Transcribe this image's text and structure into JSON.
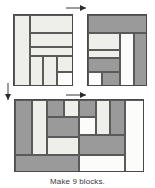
{
  "caption": "Make 9 blocks.",
  "colors": {
    "light": "#eeeeea",
    "medium": "#9a9a9a",
    "white": "#fcfcfa",
    "outline": "#4a4a4a",
    "seam": "#5a5a5a",
    "arrow": "#2a2a2a",
    "background": "#ffffff"
  },
  "arrows": [
    {
      "name": "join-top-units-arrow",
      "direction": "right"
    },
    {
      "name": "join-rows-arrow",
      "direction": "down"
    },
    {
      "name": "assemble-block-arrow",
      "direction": "right"
    }
  ],
  "units": [
    {
      "name": "top-left-unit",
      "label": "Top left unit",
      "x": 13,
      "y": 14,
      "w": 60,
      "h": 72,
      "patches": [
        {
          "name": "patch-left-tall-light",
          "fabric": "light",
          "x": 0,
          "y": 0,
          "w": 16,
          "h": 72
        },
        {
          "name": "patch-top-right-light",
          "fabric": "light",
          "x": 16,
          "y": 0,
          "w": 44,
          "h": 18
        },
        {
          "name": "patch-band-light",
          "fabric": "light",
          "x": 16,
          "y": 18,
          "w": 44,
          "h": 14
        },
        {
          "name": "patch-mid-strip-light",
          "fabric": "light",
          "x": 16,
          "y": 32,
          "w": 44,
          "h": 9
        },
        {
          "name": "patch-lower-left-light",
          "fabric": "light",
          "x": 16,
          "y": 41,
          "w": 13,
          "h": 31
        },
        {
          "name": "patch-lower-center-light",
          "fabric": "light",
          "x": 29,
          "y": 41,
          "w": 14,
          "h": 31
        },
        {
          "name": "patch-lower-right-top-light",
          "fabric": "light",
          "x": 43,
          "y": 41,
          "w": 17,
          "h": 16
        },
        {
          "name": "patch-lower-right-bot-white",
          "fabric": "white",
          "x": 43,
          "y": 57,
          "w": 17,
          "h": 15
        }
      ]
    },
    {
      "name": "top-right-unit",
      "label": "Top right unit",
      "x": 87,
      "y": 14,
      "w": 60,
      "h": 72,
      "patches": [
        {
          "name": "patch-top-band-medium",
          "fabric": "medium",
          "x": 0,
          "y": 0,
          "w": 60,
          "h": 18
        },
        {
          "name": "patch-upper-left-light",
          "fabric": "light",
          "x": 0,
          "y": 18,
          "w": 32,
          "h": 17
        },
        {
          "name": "patch-mid-left-light",
          "fabric": "light",
          "x": 0,
          "y": 35,
          "w": 32,
          "h": 8
        },
        {
          "name": "patch-mid-left-medium",
          "fabric": "medium",
          "x": 0,
          "y": 43,
          "w": 32,
          "h": 14
        },
        {
          "name": "patch-bottom-left-white",
          "fabric": "white",
          "x": 0,
          "y": 57,
          "w": 14,
          "h": 15
        },
        {
          "name": "patch-bottom-mid-medium",
          "fabric": "medium",
          "x": 14,
          "y": 57,
          "w": 18,
          "h": 15
        },
        {
          "name": "patch-tall-white",
          "fabric": "white",
          "x": 32,
          "y": 18,
          "w": 14,
          "h": 54
        },
        {
          "name": "patch-right-tall-medium",
          "fabric": "medium",
          "x": 46,
          "y": 18,
          "w": 14,
          "h": 54
        }
      ]
    },
    {
      "name": "assembled-block-unit",
      "label": "Assembled block",
      "x": 14,
      "y": 99,
      "w": 130,
      "h": 73,
      "patches": [
        {
          "name": "patch-left-tall-medium",
          "fabric": "medium",
          "x": 0,
          "y": 0,
          "w": 17,
          "h": 55
        },
        {
          "name": "patch-left-tall-light",
          "fabric": "light",
          "x": 17,
          "y": 0,
          "w": 15,
          "h": 55
        },
        {
          "name": "patch-upper-mid-medium",
          "fabric": "medium",
          "x": 32,
          "y": 0,
          "w": 17,
          "h": 17
        },
        {
          "name": "patch-upper-mid-light",
          "fabric": "light",
          "x": 49,
          "y": 0,
          "w": 15,
          "h": 17
        },
        {
          "name": "patch-upper-right-medium",
          "fabric": "medium",
          "x": 64,
          "y": 0,
          "w": 17,
          "h": 17
        },
        {
          "name": "patch-upper-right-light",
          "fabric": "light",
          "x": 81,
          "y": 0,
          "w": 14,
          "h": 35
        },
        {
          "name": "patch-upper-far-medium",
          "fabric": "medium",
          "x": 95,
          "y": 0,
          "w": 15,
          "h": 35
        },
        {
          "name": "patch-right-tall-white",
          "fabric": "white",
          "x": 110,
          "y": 0,
          "w": 20,
          "h": 73
        },
        {
          "name": "patch-center-band-medium",
          "fabric": "medium",
          "x": 32,
          "y": 17,
          "w": 32,
          "h": 20
        },
        {
          "name": "patch-center-white",
          "fabric": "white",
          "x": 64,
          "y": 17,
          "w": 17,
          "h": 18
        },
        {
          "name": "patch-mid-left-light",
          "fabric": "light",
          "x": 32,
          "y": 37,
          "w": 32,
          "h": 18
        },
        {
          "name": "patch-mid-right-medium",
          "fabric": "medium",
          "x": 64,
          "y": 35,
          "w": 46,
          "h": 20
        },
        {
          "name": "patch-bottom-left-medium",
          "fabric": "medium",
          "x": 0,
          "y": 55,
          "w": 64,
          "h": 18
        },
        {
          "name": "patch-bottom-right-white",
          "fabric": "white",
          "x": 64,
          "y": 55,
          "w": 46,
          "h": 18
        }
      ]
    }
  ]
}
